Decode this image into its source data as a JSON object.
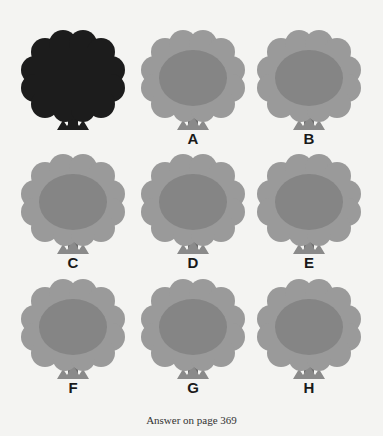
{
  "puzzle": {
    "reference": {
      "label": "",
      "color": "#1c1c1c"
    },
    "options": [
      {
        "label": "A"
      },
      {
        "label": "B"
      },
      {
        "label": "C"
      },
      {
        "label": "D"
      },
      {
        "label": "E"
      },
      {
        "label": "F"
      },
      {
        "label": "G"
      },
      {
        "label": "H"
      }
    ],
    "colors": {
      "canopy_outer": "#9a9a9a",
      "canopy_inner": "#7c7c7c",
      "trunk": "#6e6e6e",
      "grass": "#8a8a8a"
    }
  },
  "footer": {
    "text": "Answer on page 369"
  }
}
